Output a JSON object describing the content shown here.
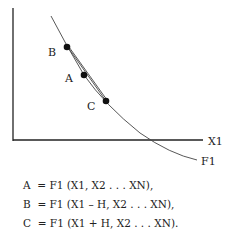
{
  "diagram": {
    "axis_x_label": "X1",
    "curve_label": "F1",
    "points": [
      {
        "id": "B",
        "label": "B"
      },
      {
        "id": "A",
        "label": "A"
      },
      {
        "id": "C",
        "label": "C"
      }
    ],
    "equations": [
      "A  = F1 (X1, X2 . . . XN),",
      "B  = F1 (X1 – H, X2 . . . XN),",
      "C  = F1 (X1 + H, X2 . . . XN)."
    ]
  }
}
